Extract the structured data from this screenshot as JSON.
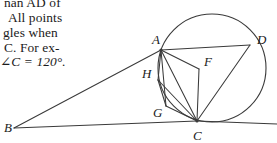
{
  "text_block": {
    "lines": [
      "nan AD of",
      "All points",
      "gles when",
      "C. For ex-",
      "∠C = 120°."
    ]
  },
  "figure": {
    "caption_labels": {
      "A": "A",
      "B": "B",
      "C": "C",
      "D": "D",
      "F": "F",
      "G": "G",
      "H": "H"
    },
    "stroke_color": "#3a3a3a",
    "circle": {
      "cx": 212,
      "cy": 68,
      "r": 54
    },
    "points": {
      "A": {
        "x": 161,
        "y": 50
      },
      "B": {
        "x": 14,
        "y": 128
      },
      "C": {
        "x": 197,
        "y": 121
      },
      "D": {
        "x": 250,
        "y": 45
      },
      "F": {
        "x": 199,
        "y": 69
      },
      "G": {
        "x": 166,
        "y": 106
      },
      "H": {
        "x": 158,
        "y": 80
      }
    },
    "label_positions": {
      "A": {
        "x": 152,
        "y": 44
      },
      "B": {
        "x": 4,
        "y": 132
      },
      "C": {
        "x": 193,
        "y": 140
      },
      "D": {
        "x": 257,
        "y": 44
      },
      "F": {
        "x": 204,
        "y": 66
      },
      "G": {
        "x": 153,
        "y": 117
      },
      "H": {
        "x": 142,
        "y": 78
      }
    },
    "segments": [
      {
        "name": "segment-BA",
        "from": "B",
        "to": "A"
      },
      {
        "name": "segment-BC",
        "from": "B",
        "to": "C"
      },
      {
        "name": "segment-AD",
        "from": "A",
        "to": "D"
      },
      {
        "name": "segment-AF",
        "from": "A",
        "to": "F"
      },
      {
        "name": "segment-AH",
        "from": "A",
        "to": "H"
      },
      {
        "name": "segment-AG",
        "from": "A",
        "to": "G"
      },
      {
        "name": "segment-AC",
        "from": "A",
        "to": "C"
      },
      {
        "name": "segment-FC",
        "from": "F",
        "to": "C"
      },
      {
        "name": "segment-HG",
        "from": "H",
        "to": "G"
      },
      {
        "name": "segment-HC",
        "from": "H",
        "to": "C"
      },
      {
        "name": "segment-GC",
        "from": "G",
        "to": "C"
      },
      {
        "name": "segment-DC",
        "from": "D",
        "to": "C"
      }
    ],
    "tangent_extension": {
      "x1": 197,
      "y1": 121,
      "x2": 277,
      "y2": 124
    }
  }
}
